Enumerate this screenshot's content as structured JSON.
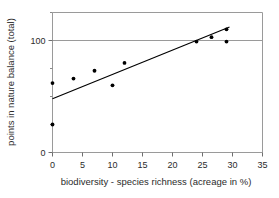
{
  "chart_data": {
    "type": "scatter",
    "title": "",
    "subtitle": "",
    "xlabel": "biodiversity - species richness (acreage in %)",
    "ylabel": "points in nature balance (total)",
    "xlim": [
      0,
      35
    ],
    "ylim": [
      0,
      125
    ],
    "xticks": [
      0,
      5,
      10,
      15,
      20,
      25,
      30,
      35
    ],
    "xticklabels": [
      "0",
      "5",
      "10",
      "15",
      "20",
      "25",
      "30",
      "35"
    ],
    "yticks": [
      0,
      100
    ],
    "yticklabels": [
      "0",
      "100"
    ],
    "y_minor_ticks": [
      25,
      50,
      75,
      125
    ],
    "grid": "horizontal-at-100",
    "legend": "none",
    "marker_color": "#000000",
    "line_color": "#000000",
    "frame_color": "#9a9a9a",
    "series": [
      {
        "name": "observations",
        "marker": "filled-circle",
        "points": [
          {
            "x": 0.0,
            "y": 62
          },
          {
            "x": 0.0,
            "y": 25
          },
          {
            "x": 3.5,
            "y": 66
          },
          {
            "x": 7.0,
            "y": 73
          },
          {
            "x": 10.0,
            "y": 60
          },
          {
            "x": 12.0,
            "y": 80
          },
          {
            "x": 24.0,
            "y": 99
          },
          {
            "x": 26.5,
            "y": 103
          },
          {
            "x": 29.0,
            "y": 110
          },
          {
            "x": 29.0,
            "y": 99
          }
        ]
      },
      {
        "name": "trend-line",
        "marker": "none",
        "points": [
          {
            "x": 0.0,
            "y": 48
          },
          {
            "x": 29.5,
            "y": 112
          }
        ]
      }
    ]
  }
}
